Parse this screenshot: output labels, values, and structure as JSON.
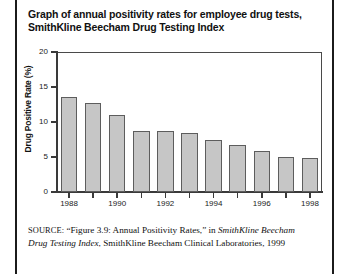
{
  "figure": {
    "title_lines": [
      "Graph of annual positivity rates for employee drug tests,",
      "SmithKline Beecham Drug Testing Index"
    ],
    "border_color": "#1b1b1b"
  },
  "source_note": {
    "label": "SOURCE:",
    "text_part1": "“Figure 3.9: Annual Positivity Rates,” in ",
    "italic1": "SmithKline Beecham Drug Testing Index",
    "text_part2": ", SmithKline Beecham Clinical Laboratories, 1999"
  },
  "chart_data": {
    "type": "bar",
    "title": "Graph of annual positivity rates for employee drug tests, SmithKline Beecham Drug Testing Index",
    "xlabel": "",
    "ylabel": "Drug Positive Rate (%)",
    "categories": [
      "1988",
      "1989",
      "1990",
      "1991",
      "1992",
      "1993",
      "1994",
      "1995",
      "1996",
      "1997",
      "1998"
    ],
    "values": [
      13.6,
      12.7,
      11.0,
      8.7,
      8.7,
      8.4,
      7.4,
      6.7,
      5.8,
      5.0,
      4.8
    ],
    "ylim": [
      0,
      20
    ],
    "yticks": [
      0,
      5,
      10,
      15,
      20
    ],
    "ytick_labels": [
      "0",
      "5",
      "10",
      "15",
      "20"
    ],
    "xtick_labels": [
      "1988",
      "1990",
      "1992",
      "1994",
      "1996",
      "1998"
    ],
    "xtick_categories": [
      "1988",
      "1990",
      "1992",
      "1994",
      "1996",
      "1998"
    ],
    "grid": false,
    "legend": null,
    "bar_color": "#c6c6c6",
    "bar_edge_color": "#5d5d5d",
    "axis_color": "#3a3a3a"
  }
}
